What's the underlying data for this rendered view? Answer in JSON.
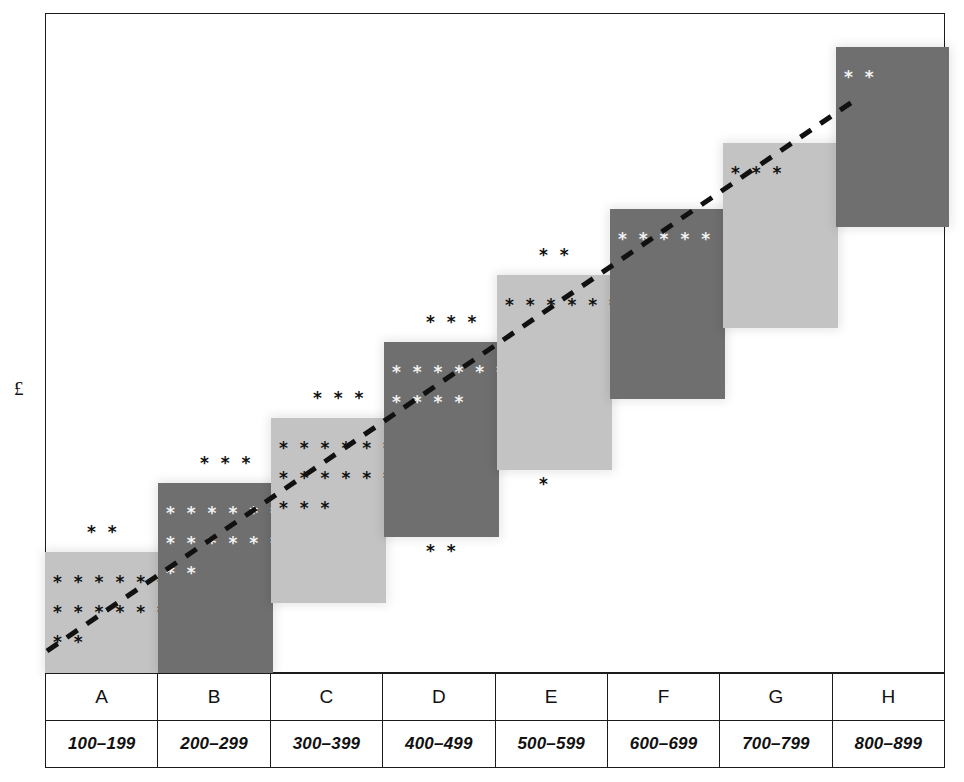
{
  "chart_data": {
    "type": "bar",
    "title": "",
    "subtitle": "",
    "xlabel": "",
    "ylabel": "£",
    "grid": false,
    "legend": "none",
    "categories": [
      "A",
      "B",
      "C",
      "D",
      "E",
      "F",
      "G",
      "H"
    ],
    "category_ranges": [
      "100–199",
      "200–299",
      "300–399",
      "400–499",
      "500–599",
      "600–699",
      "700–799",
      "800–899"
    ],
    "series": [
      {
        "name": "Block value (staircase step height)",
        "values": [
          1,
          2,
          3,
          4,
          5,
          6,
          7,
          8
        ]
      },
      {
        "name": "Observation marks inside block",
        "values": [
          22,
          23,
          25,
          14,
          8,
          5,
          3,
          2
        ]
      },
      {
        "name": "Observation marks above block",
        "values": [
          2,
          3,
          3,
          3,
          2,
          0,
          0,
          0
        ]
      },
      {
        "name": "Observation marks below block",
        "values": [
          0,
          2,
          0,
          2,
          1,
          0,
          0,
          0
        ]
      }
    ],
    "trendline": {
      "style": "dashed",
      "color": "#111111",
      "from": [
        47,
        651
      ],
      "to": [
        855,
        100
      ]
    }
  },
  "axis": {
    "y_label": "£"
  },
  "blocks": [
    {
      "id": "A",
      "shade": "light",
      "left": 0,
      "top": 539,
      "width": 115,
      "height": 121,
      "marks_above": "* *",
      "rows": [
        "* * * * * * * * * *",
        "* * * * * * * * * *",
        "* *"
      ]
    },
    {
      "id": "B",
      "shade": "dark",
      "left": 113,
      "top": 470,
      "width": 115,
      "height": 190,
      "marks_above": "* * *",
      "marks_below": "* *",
      "rows": [
        "* * * * * * * * * * *",
        "* * * * * * * * * *",
        "* *"
      ]
    },
    {
      "id": "C",
      "shade": "light",
      "left": 226,
      "top": 405,
      "width": 115,
      "height": 185,
      "marks_above": "* * *",
      "rows": [
        "* * * * * * * * * * *",
        "* * * * * * * * * * *",
        "* * *"
      ]
    },
    {
      "id": "D",
      "shade": "dark",
      "left": 339,
      "top": 329,
      "width": 115,
      "height": 195,
      "marks_above": "* * *",
      "marks_below": "* *",
      "rows": [
        "* * * * * * * * * *",
        "* * * *"
      ]
    },
    {
      "id": "E",
      "shade": "light",
      "left": 452,
      "top": 262,
      "width": 115,
      "height": 195,
      "marks_above": "* *",
      "marks_below": "*",
      "rows": [
        "* * * * * * * *"
      ]
    },
    {
      "id": "F",
      "shade": "dark",
      "left": 565,
      "top": 196,
      "width": 115,
      "height": 190,
      "rows": [
        "* * * * *"
      ]
    },
    {
      "id": "G",
      "shade": "light",
      "left": 678,
      "top": 130,
      "width": 115,
      "height": 185,
      "rows": [
        "* * *"
      ]
    },
    {
      "id": "H",
      "shade": "dark",
      "left": 791,
      "top": 34,
      "width": 113,
      "height": 180,
      "rows": [
        "* *"
      ]
    }
  ],
  "table": {
    "letters": [
      "A",
      "B",
      "C",
      "D",
      "E",
      "F",
      "G",
      "H"
    ],
    "ranges": [
      "100–199",
      "200–299",
      "300–399",
      "400–499",
      "500–599",
      "600–699",
      "700–799",
      "800–899"
    ]
  },
  "colors": {
    "light_block": "#c3c3c3",
    "dark_block": "#6f6f6f",
    "ink": "#111111",
    "white_marks": "#f2f2f2",
    "background": "#ffffff"
  }
}
